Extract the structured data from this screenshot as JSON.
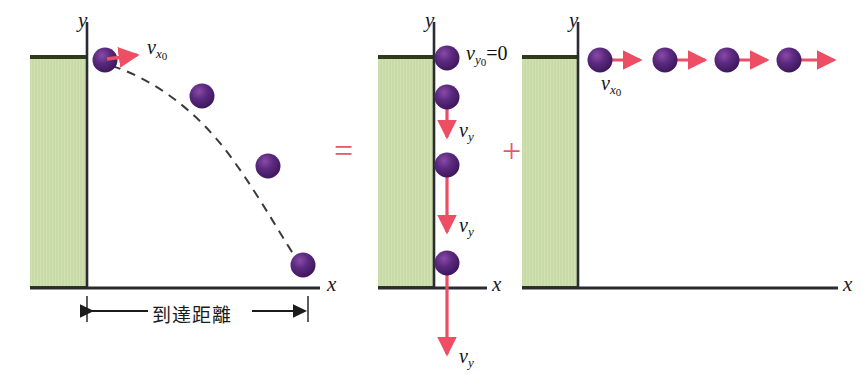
{
  "figure": {
    "colors": {
      "ball": "#4d2070",
      "ball_highlight": "#7b3f9d",
      "arrow": "#ee4e63",
      "wall_fill": "#cfe0b0",
      "wall_edge": "#2d3a1c",
      "axis": "#2b2b33",
      "trajectory": "#3a3a3a",
      "operator": "#e8576b"
    },
    "panels": [
      {
        "id": "combined",
        "axis_y_label": "y",
        "axis_x_label": "x",
        "velocity_label": "v",
        "velocity_sub": "x",
        "velocity_sub2": "0",
        "range_label": "到達距離",
        "balls": [
          {
            "x": 105,
            "y": 60
          },
          {
            "x": 202,
            "y": 96
          },
          {
            "x": 268,
            "y": 166
          },
          {
            "x": 303,
            "y": 265
          }
        ]
      },
      {
        "id": "vertical",
        "axis_y_label": "y",
        "axis_x_label": "x",
        "initial_label": "v",
        "initial_sub": "y",
        "initial_sub2": "0",
        "initial_eq": "=0",
        "vy_label": "v",
        "vy_sub": "y",
        "balls": [
          {
            "x": 447,
            "y": 58
          },
          {
            "x": 447,
            "y": 97
          },
          {
            "x": 447,
            "y": 165
          },
          {
            "x": 447,
            "y": 263
          }
        ],
        "vy_labels_count": 3
      },
      {
        "id": "horizontal",
        "axis_y_label": "y",
        "axis_x_label": "x",
        "velocity_label": "v",
        "velocity_sub": "x",
        "velocity_sub2": "0",
        "balls": [
          {
            "x": 600,
            "y": 60
          },
          {
            "x": 665,
            "y": 60
          },
          {
            "x": 727,
            "y": 60
          },
          {
            "x": 789,
            "y": 60
          }
        ]
      }
    ],
    "operators": [
      {
        "symbol": "=",
        "x": 340,
        "y": 150
      },
      {
        "symbol": "+",
        "x": 508,
        "y": 150
      }
    ]
  }
}
